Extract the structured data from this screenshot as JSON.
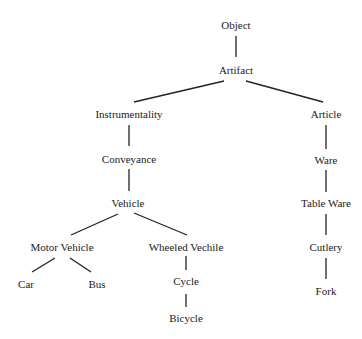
{
  "diagram": {
    "type": "taxonomy-tree",
    "nodes": {
      "object": {
        "label": "Object",
        "x": 236,
        "y": 25
      },
      "artifact": {
        "label": "Artifact",
        "x": 236,
        "y": 70
      },
      "instrumentality": {
        "label": "Instrumentality",
        "x": 129,
        "y": 114
      },
      "article": {
        "label": "Article",
        "x": 326,
        "y": 114
      },
      "conveyance": {
        "label": "Conveyance",
        "x": 129,
        "y": 159
      },
      "ware": {
        "label": "Ware",
        "x": 326,
        "y": 160
      },
      "vehicle": {
        "label": "Vehicle",
        "x": 128,
        "y": 203
      },
      "table_ware": {
        "label": "Table Ware",
        "x": 326,
        "y": 203
      },
      "motor_vehicle": {
        "label": "Motor Vehicle",
        "x": 62,
        "y": 247
      },
      "wheeled_vechile": {
        "label": "Wheeled Vechile",
        "x": 186,
        "y": 247
      },
      "cutlery": {
        "label": "Cutlery",
        "x": 326,
        "y": 247
      },
      "car": {
        "label": "Car",
        "x": 26,
        "y": 284
      },
      "bus": {
        "label": "Bus",
        "x": 97,
        "y": 284
      },
      "cycle": {
        "label": "Cycle",
        "x": 186,
        "y": 281
      },
      "fork": {
        "label": "Fork",
        "x": 326,
        "y": 291
      },
      "bicycle": {
        "label": "Bicycle",
        "x": 186,
        "y": 318
      }
    },
    "edges": [
      {
        "from": "object",
        "to": "artifact",
        "x1": 236,
        "y1": 36,
        "x2": 236,
        "y2": 57
      },
      {
        "from": "artifact",
        "to": "instrumentality",
        "x1": 224,
        "y1": 81,
        "x2": 134,
        "y2": 102
      },
      {
        "from": "artifact",
        "to": "article",
        "x1": 246,
        "y1": 81,
        "x2": 323,
        "y2": 102
      },
      {
        "from": "instrumentality",
        "to": "conveyance",
        "x1": 129,
        "y1": 125,
        "x2": 129,
        "y2": 146
      },
      {
        "from": "conveyance",
        "to": "vehicle",
        "x1": 129,
        "y1": 169,
        "x2": 129,
        "y2": 191
      },
      {
        "from": "vehicle",
        "to": "motor_vehicle",
        "x1": 118,
        "y1": 214,
        "x2": 71,
        "y2": 235
      },
      {
        "from": "vehicle",
        "to": "wheeled_vechile",
        "x1": 134,
        "y1": 213,
        "x2": 187,
        "y2": 235
      },
      {
        "from": "motor_vehicle",
        "to": "car",
        "x1": 55,
        "y1": 258,
        "x2": 32,
        "y2": 272
      },
      {
        "from": "motor_vehicle",
        "to": "bus",
        "x1": 70,
        "y1": 258,
        "x2": 91,
        "y2": 272
      },
      {
        "from": "wheeled_vechile",
        "to": "cycle",
        "x1": 186,
        "y1": 256,
        "x2": 186,
        "y2": 270
      },
      {
        "from": "cycle",
        "to": "bicycle",
        "x1": 186,
        "y1": 294,
        "x2": 186,
        "y2": 307
      },
      {
        "from": "article",
        "to": "ware",
        "x1": 326,
        "y1": 125,
        "x2": 326,
        "y2": 149
      },
      {
        "from": "ware",
        "to": "table_ware",
        "x1": 326,
        "y1": 170,
        "x2": 326,
        "y2": 192
      },
      {
        "from": "table_ware",
        "to": "cutlery",
        "x1": 326,
        "y1": 214,
        "x2": 326,
        "y2": 235
      },
      {
        "from": "cutlery",
        "to": "fork",
        "x1": 326,
        "y1": 258,
        "x2": 326,
        "y2": 279
      }
    ]
  }
}
